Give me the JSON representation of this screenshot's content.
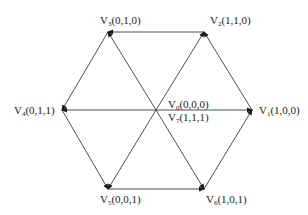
{
  "diagram": {
    "center": {
      "x": 156,
      "y": 110
    },
    "line_color": "#3a3a3a",
    "vertices": [
      {
        "id": "V1",
        "name": "V",
        "sub": "1",
        "state": "(1,0,0)",
        "x": 252,
        "y": 110,
        "lx": 259,
        "ly": 104
      },
      {
        "id": "V2",
        "name": "V",
        "sub": "2",
        "state": "(1,1,0)",
        "x": 204,
        "y": 32,
        "lx": 210,
        "ly": 14
      },
      {
        "id": "V3",
        "name": "V",
        "sub": "3",
        "state": "(0,1,0)",
        "x": 108,
        "y": 32,
        "lx": 100,
        "ly": 14
      },
      {
        "id": "V4",
        "name": "V",
        "sub": "4",
        "state": "(0,1,1)",
        "x": 62,
        "y": 110,
        "lx": 14,
        "ly": 104
      },
      {
        "id": "V5",
        "name": "V",
        "sub": "5",
        "state": "(0,0,1)",
        "x": 108,
        "y": 189,
        "lx": 100,
        "ly": 193
      },
      {
        "id": "V6",
        "name": "V",
        "sub": "6",
        "state": "(1,0,1)",
        "x": 204,
        "y": 189,
        "lx": 206,
        "ly": 193
      }
    ],
    "center_labels": [
      {
        "id": "V0",
        "name": "V",
        "sub": "0",
        "state": "(0,0,0)",
        "lx": 168,
        "ly": 98
      },
      {
        "id": "V7",
        "name": "V",
        "sub": "7",
        "state": "(1,1,1)",
        "lx": 168,
        "ly": 111
      }
    ]
  }
}
